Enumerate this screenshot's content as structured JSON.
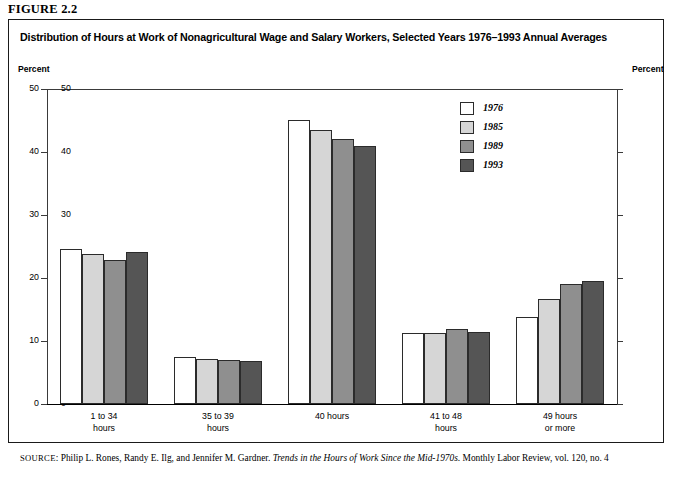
{
  "figure_label": "FIGURE 2.2",
  "title": "Distribution of Hours at Work of Nonagricultural Wage and Salary Workers, Selected Years 1976–1993 Annual Averages",
  "axis_unit_left": "Percent",
  "axis_unit_right": "Percent",
  "source": {
    "prefix": "SOURCE",
    "authors": ": Philip L. Rones, Randy E. Ilg, and Jennifer M. Gardner.  ",
    "work_italic": "Trends in the Hours of Work Since the Mid-1970s",
    "publication": ". Monthly Labor Review, vol. 120, no. 4"
  },
  "colors": {
    "series_1976": "#ffffff",
    "series_1985": "#d6d6d6",
    "series_1989": "#8f8f8f",
    "series_1993": "#555555",
    "bar_outline": "#2b2b2b",
    "axis": "#3a3a3a",
    "frame": "#1a1a1a"
  },
  "chart_data": {
    "type": "bar",
    "title": "Distribution of Hours at Work of Nonagricultural Wage and Salary Workers, Selected Years 1976–1993 Annual Averages",
    "xlabel": "",
    "ylabel": "Percent",
    "ylim": [
      0,
      50
    ],
    "yticks": [
      0,
      10,
      20,
      30,
      40,
      50
    ],
    "grid": false,
    "legend_position": "inside-upper-right",
    "categories": [
      "1 to 34\nhours",
      "35 to 39\nhours",
      "40 hours",
      "41 to 48\nhours",
      "49 hours\nor more"
    ],
    "series": [
      {
        "name": "1976",
        "color": "#ffffff",
        "values": [
          24.6,
          7.4,
          45.1,
          11.2,
          13.8
        ]
      },
      {
        "name": "1985",
        "color": "#d6d6d6",
        "values": [
          23.8,
          7.2,
          43.5,
          11.2,
          16.7
        ]
      },
      {
        "name": "1989",
        "color": "#8f8f8f",
        "values": [
          22.8,
          7.0,
          42.1,
          11.9,
          19.0
        ]
      },
      {
        "name": "1993",
        "color": "#555555",
        "values": [
          24.2,
          6.9,
          40.9,
          11.5,
          19.6
        ]
      }
    ]
  }
}
